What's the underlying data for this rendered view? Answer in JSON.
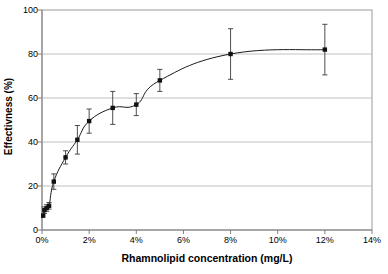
{
  "chart_data": {
    "type": "line",
    "title": "",
    "xlabel": "Rhamnolipid concentration (mg/L)",
    "ylabel": "Effectivness (%)",
    "xlim": [
      0,
      14
    ],
    "ylim": [
      0,
      100
    ],
    "xtick_labels": [
      "0%",
      "2%",
      "4%",
      "6%",
      "8%",
      "10%",
      "12%",
      "14%"
    ],
    "xtick_values": [
      0,
      2,
      4,
      6,
      8,
      10,
      12,
      14
    ],
    "ytick_labels": [
      "0",
      "20",
      "40",
      "60",
      "80",
      "100"
    ],
    "ytick_values": [
      0,
      20,
      40,
      60,
      80,
      100
    ],
    "grid": "horizontal",
    "legend": "none",
    "marker": "square",
    "error_bars": "vertical",
    "x": [
      0.05,
      0.1,
      0.2,
      0.3,
      0.5,
      1,
      1.5,
      2,
      3,
      4,
      5,
      8,
      12
    ],
    "values": [
      6.5,
      9,
      10,
      11,
      22,
      33,
      41,
      49.5,
      55.5,
      57,
      68,
      80,
      82
    ],
    "errors": [
      0,
      1.5,
      1.5,
      1.5,
      3.5,
      3,
      6.5,
      5.5,
      7.5,
      5,
      5,
      11.5,
      11.5
    ],
    "series": [
      {
        "name": "Effectivness",
        "x": [
          0.05,
          0.1,
          0.2,
          0.3,
          0.5,
          1,
          1.5,
          2,
          3,
          4,
          5,
          8,
          12
        ],
        "values": [
          6.5,
          9,
          10,
          11,
          22,
          33,
          41,
          49.5,
          55.5,
          57,
          68,
          80,
          82
        ],
        "errors": [
          0,
          1.5,
          1.5,
          1.5,
          3.5,
          3,
          6.5,
          5.5,
          7.5,
          5,
          5,
          11.5,
          11.5
        ]
      }
    ]
  },
  "colors": {
    "line": "#1a1a1a",
    "marker": "#111111",
    "grid": "#b0b0b0",
    "frame": "#9a9a9a",
    "background": "#ffffff"
  }
}
